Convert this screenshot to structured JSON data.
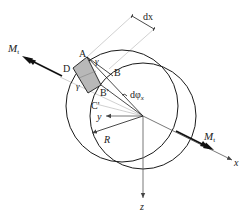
{
  "figure": {
    "type": "shaft torsion element diagram",
    "colors": {
      "line": "#1a1a1a",
      "guide": "#bdbdbd",
      "shade": "#b8b8b8",
      "background": "#ffffff"
    }
  },
  "labels": {
    "moment_left": "M",
    "moment_left_sub": "t",
    "moment_right": "M",
    "moment_right_sub": "t",
    "point_a": "A",
    "point_b": "B",
    "point_b_prime": "B'",
    "point_c_prime": "C'",
    "point_d": "D",
    "gamma_top": "γ",
    "gamma_left": "γ",
    "dx": "dx",
    "dphi": "dφ",
    "dphi_sub": "x",
    "axis_x": "x",
    "axis_y": "y",
    "axis_z": "z",
    "radius": "R"
  }
}
